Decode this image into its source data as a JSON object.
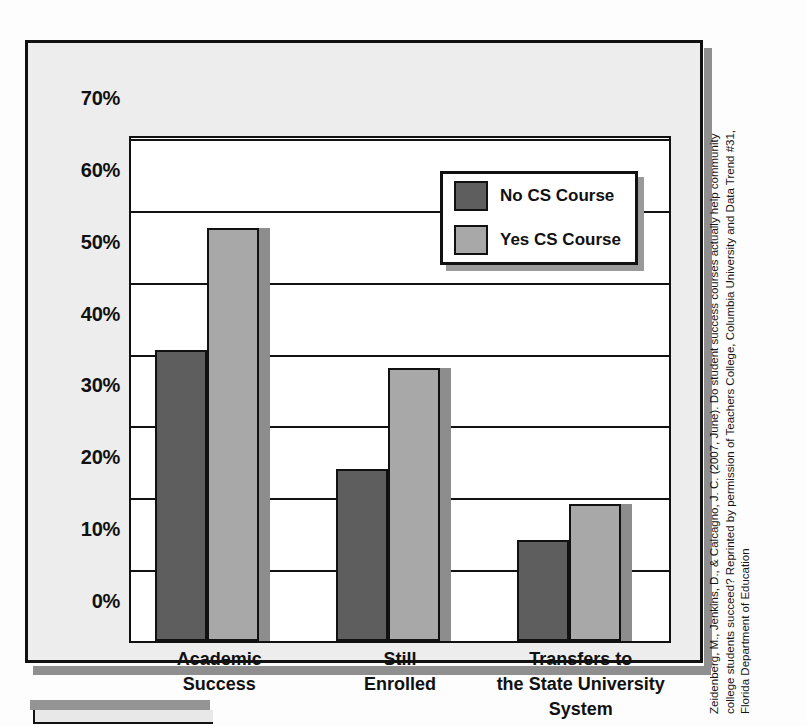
{
  "chart_data": {
    "type": "bar",
    "title": "",
    "xlabel": "",
    "ylabel": "",
    "ylim": [
      0,
      70
    ],
    "grid": true,
    "legend_position": "inside-top-right",
    "categories": [
      "Academic\nSuccess",
      "Still\nEnrolled",
      "Transfers to\nthe State University\nSystem"
    ],
    "category_lines": [
      [
        "Academic",
        "Success"
      ],
      [
        "Still",
        "Enrolled"
      ],
      [
        "Transfers to",
        "the State University",
        "System"
      ]
    ],
    "ytick_labels": [
      "70%",
      "60%",
      "50%",
      "40%",
      "30%",
      "20%",
      "10%",
      "0%"
    ],
    "ytick_values": [
      70,
      60,
      50,
      40,
      30,
      20,
      10,
      0
    ],
    "series": [
      {
        "name": "No CS Course",
        "color": "#5e5e5e",
        "values": [
          40.5,
          24.0,
          14.0
        ]
      },
      {
        "name": "Yes CS Course",
        "color": "#a8a8a8",
        "values": [
          57.5,
          38.0,
          19.0
        ]
      }
    ]
  },
  "legend": {
    "items": [
      {
        "label": "No CS Course",
        "swatch": "dark"
      },
      {
        "label": "Yes CS Course",
        "swatch": "light"
      }
    ]
  },
  "caption": {
    "line1": "Zeidenberg, M., Jenkins, D., & Calcagno, J. C. (2007, June). Do student success courses actually help community",
    "line2": "college students succeed? Reprinted by permission of Teachers College, Columbia University and Data Trend #31,",
    "line3": "Florida Department of Education"
  },
  "colors": {
    "no_cs": "#5e5e5e",
    "yes_cs": "#a8a8a8",
    "frame_bg": "#ededed",
    "plot_bg": "#ffffff",
    "ink": "#111111"
  }
}
